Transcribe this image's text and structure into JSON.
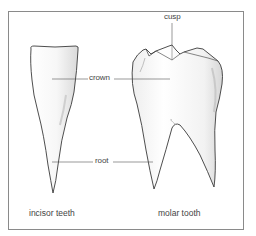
{
  "diagram": {
    "labels": {
      "crown": "crown",
      "root": "root",
      "cusp": "cusp"
    },
    "captions": {
      "incisor": "incisor teeth",
      "molar": "molar tooth"
    },
    "colors": {
      "outline": "#3a3a3a",
      "leader_line": "#555555",
      "frame": "#8a8a8a",
      "shading": "#d8d8d8",
      "text": "#444444"
    }
  }
}
